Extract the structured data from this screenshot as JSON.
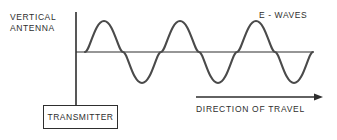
{
  "diagram": {
    "background_color": "#ffffff",
    "ink_color": "#2e2e2e",
    "labels": {
      "antenna_line1": "VERTICAL",
      "antenna_line2": "ANTENNA",
      "waves": "E - WAVES",
      "direction": "DIRECTION OF TRAVEL",
      "transmitter": "TRANSMITTER"
    },
    "antenna": {
      "x": 76,
      "y_top": 12,
      "y_bottom": 105,
      "stroke_width": 1.6
    },
    "transmitter_box": {
      "x": 43,
      "y": 105,
      "width": 75,
      "height": 24,
      "stroke_width": 1.4
    },
    "baseline": {
      "x_start": 76,
      "x_end": 313,
      "y": 52,
      "stroke_width": 1.2
    },
    "direction_arrow": {
      "x_start": 196,
      "x_end": 323,
      "y": 97,
      "stroke_width": 1.4,
      "head_length": 9,
      "head_half_width": 3.5
    },
    "wave": {
      "x_start": 85,
      "x_end": 313,
      "baseline_y": 52,
      "amplitude": 31,
      "wavelength": 76,
      "cycles": 3,
      "phase": "positive-first",
      "stroke_width": 2.1,
      "stroke_color": "#4a4a4a",
      "crest_y": 21,
      "trough_y": 83,
      "zero_crossings": [
        85,
        123,
        161,
        199,
        237,
        275,
        313
      ],
      "crest_x": [
        104,
        180,
        256
      ],
      "trough_x": [
        142,
        218,
        294
      ]
    }
  }
}
